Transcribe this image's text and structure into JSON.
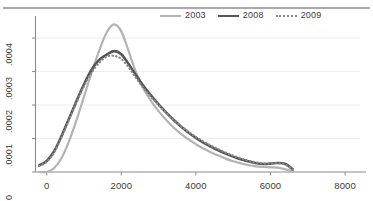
{
  "chart_data": {
    "type": "line",
    "title": "",
    "subtitle": "",
    "xlabel": "",
    "ylabel": "",
    "xlim": [
      -300,
      8400
    ],
    "ylim": [
      0,
      0.00046
    ],
    "grid": true,
    "legend_position": "top-right",
    "x_ticks": [
      {
        "value": 0,
        "label": "0"
      },
      {
        "value": 2000,
        "label": "2000"
      },
      {
        "value": 4000,
        "label": "4000"
      },
      {
        "value": 6000,
        "label": "6000"
      },
      {
        "value": 8000,
        "label": "8000"
      }
    ],
    "y_ticks": [
      {
        "value": 0,
        "label": "0"
      },
      {
        "value": 0.0001,
        "label": ".0001"
      },
      {
        "value": 0.0002,
        "label": ".0002"
      },
      {
        "value": 0.0003,
        "label": ".0003"
      },
      {
        "value": 0.0004,
        "label": ".0004"
      }
    ],
    "x": [
      -200,
      0,
      200,
      400,
      600,
      800,
      1000,
      1200,
      1400,
      1600,
      1800,
      2000,
      2200,
      2400,
      2600,
      2800,
      3000,
      3200,
      3400,
      3600,
      3800,
      4000,
      4200,
      4400,
      4600,
      4800,
      5000,
      5200,
      5400,
      5600,
      5800,
      6000,
      6200,
      6400,
      6600
    ],
    "series": [
      {
        "name": "2003",
        "color": "#b3b3b3",
        "style": "solid",
        "width": 2.2,
        "peak_x": 1700,
        "peak_y": 0.000442,
        "values": [
          0.0,
          0.0,
          1.2e-05,
          4.2e-05,
          9.2e-05,
          0.000155,
          0.000225,
          0.000295,
          0.00036,
          0.000415,
          0.000441,
          0.00042,
          0.00036,
          0.000296,
          0.000248,
          0.000212,
          0.000182,
          0.000156,
          0.000133,
          0.000114,
          9.8e-05,
          8.3e-05,
          7e-05,
          5.9e-05,
          4.9e-05,
          4e-05,
          3.2e-05,
          2.6e-05,
          2.1e-05,
          1.7e-05,
          1.5e-05,
          1.4e-05,
          1.3e-05,
          8e-06,
          2e-06
        ]
      },
      {
        "name": "2008",
        "color": "#575757",
        "style": "solid",
        "width": 2.6,
        "peak_x": 1750,
        "peak_y": 0.000362,
        "values": [
          2e-05,
          3.3e-05,
          6.2e-05,
          0.000108,
          0.00016,
          0.000212,
          0.000262,
          0.000305,
          0.000334,
          0.00035,
          0.000361,
          0.000352,
          0.000322,
          0.000288,
          0.000256,
          0.000228,
          0.000202,
          0.000178,
          0.000156,
          0.000136,
          0.000118,
          0.000102,
          8.8e-05,
          7.6e-05,
          6.5e-05,
          5.5e-05,
          4.6e-05,
          3.8e-05,
          3.2e-05,
          2.7e-05,
          2.4e-05,
          2.5e-05,
          2.7e-05,
          2.4e-05,
          8e-06
        ]
      },
      {
        "name": "2009",
        "color": "#8a8a8a",
        "style": "dotted",
        "width": 2.2,
        "peak_x": 1700,
        "peak_y": 0.000348,
        "values": [
          1.8e-05,
          3e-05,
          5.8e-05,
          0.000104,
          0.000156,
          0.000208,
          0.000256,
          0.000296,
          0.000325,
          0.000344,
          0.000347,
          0.000338,
          0.000312,
          0.00028,
          0.00025,
          0.000224,
          0.0002,
          0.000177,
          0.000156,
          0.000137,
          0.00012,
          0.000105,
          9.1e-05,
          7.9e-05,
          6.8e-05,
          5.8e-05,
          4.9e-05,
          4.1e-05,
          3.4e-05,
          2.9e-05,
          2.6e-05,
          2.6e-05,
          2.6e-05,
          2.2e-05,
          7e-06
        ]
      }
    ],
    "legend_entries": [
      {
        "label": "2003",
        "color": "#b3b3b3",
        "style": "solid"
      },
      {
        "label": "2008",
        "color": "#575757",
        "style": "solid"
      },
      {
        "label": "2009",
        "color": "#8a8a8a",
        "style": "dotted"
      }
    ]
  },
  "style": {
    "background": "#ffffff",
    "axis_color": "#8c8c8c",
    "grid_color": "#ededed",
    "text_color": "#3c3c3c",
    "top_rule_color": "#a9a9a9"
  }
}
